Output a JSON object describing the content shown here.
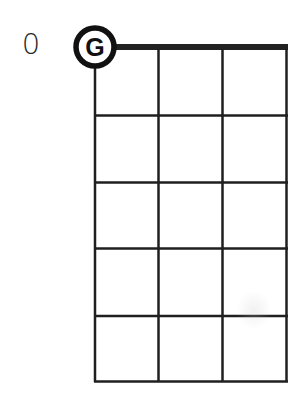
{
  "diagram": {
    "type": "chord-diagram",
    "fret_position_label": "0",
    "strings": 4,
    "frets": 5,
    "open_string_marker": {
      "label": "G",
      "string_index": 0,
      "fret": 0
    },
    "colors": {
      "line": "#1f1f1f",
      "nut": "#222222",
      "background": "#ffffff"
    }
  }
}
